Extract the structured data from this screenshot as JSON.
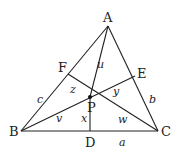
{
  "diagram": {
    "points": {
      "A": {
        "label": "A",
        "x": 108,
        "y": 26
      },
      "B": {
        "label": "B",
        "x": 21,
        "y": 131
      },
      "C": {
        "label": "C",
        "x": 158,
        "y": 131
      },
      "P": {
        "label": "P",
        "x": 90,
        "y": 97
      },
      "D": {
        "label": "D",
        "x": 90,
        "y": 131
      },
      "E": {
        "label": "E",
        "x": 135,
        "y": 76
      },
      "F": {
        "label": "F",
        "x": 68,
        "y": 74
      }
    },
    "side_labels": {
      "a": "a",
      "b": "b",
      "c": "c"
    },
    "segment_labels": {
      "u": "u",
      "v": "v",
      "w": "w",
      "x": "x",
      "y": "y",
      "z": "z"
    },
    "colors": {
      "stroke": "#222222",
      "background": "#ffffff"
    }
  }
}
